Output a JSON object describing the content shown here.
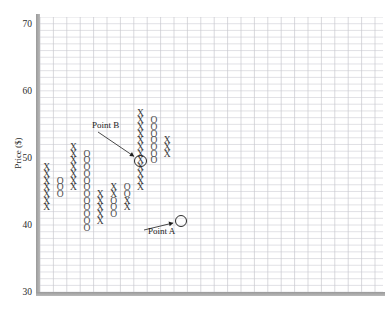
{
  "chart": {
    "type": "point-and-figure",
    "ylabel": "Price ($)",
    "yticks": [
      70,
      60,
      50,
      40,
      30
    ],
    "ylim": [
      30,
      71
    ],
    "xlim": [
      0,
      25
    ],
    "grid": true,
    "grid_color": "#c8c8cf",
    "axis_color": "#9a9a9a",
    "cell_width": 13.4,
    "cell_height": 6.71,
    "annotations": [
      {
        "label": "Point B",
        "marker": "X",
        "col": 8,
        "price": 50,
        "label_x": 92,
        "label_y": 120
      },
      {
        "label": "Point A",
        "marker": "X",
        "col": 11,
        "price": 41,
        "label_x": 148,
        "label_y": 226
      }
    ],
    "columns": [
      {
        "col": 1,
        "mark": "X",
        "prices": [
          41,
          42,
          43,
          44,
          45,
          46,
          47,
          48,
          49,
          50,
          51
        ]
      },
      {
        "col": 2,
        "mark": "O",
        "prices": [
          45,
          46,
          47,
          48,
          49
        ]
      },
      {
        "col": 3,
        "mark": "X",
        "prices": [
          47,
          48,
          49,
          50,
          51,
          52,
          53,
          54,
          55,
          56
        ]
      },
      {
        "col": 4,
        "mark": "O",
        "prices": [
          44,
          45,
          46,
          47,
          48,
          49,
          50,
          51,
          52,
          53,
          54,
          55
        ]
      },
      {
        "col": 5,
        "mark": "X",
        "prices": [
          44
        ]
      },
      {
        "col": 6,
        "mark": "O",
        "prices": [
          35,
          36,
          37,
          38,
          39,
          40,
          41,
          42,
          43
        ]
      },
      {
        "col": 7,
        "mark": "X",
        "prices": [
          37,
          38,
          39,
          40,
          41,
          42
        ]
      },
      {
        "col": 8,
        "mark": "O",
        "prices": [
          39,
          40,
          41,
          42
        ]
      },
      {
        "col": 9,
        "mark": "X",
        "prices": [
          41
        ]
      },
      {
        "col": 10,
        "mark": "X",
        "prices": [
          47,
          48
        ]
      },
      {
        "col": 11,
        "mark": "O",
        "prices": [
          47
        ]
      },
      {
        "col": 12,
        "mark": "X",
        "prices": [
          47,
          48,
          49,
          50,
          51,
          52,
          53,
          54,
          55,
          56,
          57
        ]
      },
      {
        "col": 13,
        "mark": "O",
        "prices": [
          50,
          51,
          52,
          53,
          54,
          55,
          56
        ]
      },
      {
        "col": 14,
        "mark": "X",
        "prices": [
          53,
          54,
          55,
          56
        ]
      }
    ],
    "cells": [
      {
        "c": 8,
        "r": 57,
        "m": "X"
      },
      {
        "c": 8,
        "r": 56,
        "m": "X"
      },
      {
        "c": 9,
        "r": 56,
        "m": "O"
      },
      {
        "c": 8,
        "r": 55,
        "m": "X"
      },
      {
        "c": 9,
        "r": 55,
        "m": "O"
      },
      {
        "c": 8,
        "r": 54,
        "m": "X"
      },
      {
        "c": 9,
        "r": 54,
        "m": "O"
      },
      {
        "c": 8,
        "r": 53,
        "m": "X"
      },
      {
        "c": 9,
        "r": 53,
        "m": "O"
      },
      {
        "c": 10,
        "r": 53,
        "m": "X"
      },
      {
        "c": 3,
        "r": 52,
        "m": "X"
      },
      {
        "c": 8,
        "r": 52,
        "m": "X"
      },
      {
        "c": 9,
        "r": 52,
        "m": "O"
      },
      {
        "c": 10,
        "r": 52,
        "m": "X"
      },
      {
        "c": 3,
        "r": 51,
        "m": "X"
      },
      {
        "c": 4,
        "r": 51,
        "m": "O"
      },
      {
        "c": 8,
        "r": 51,
        "m": "X"
      },
      {
        "c": 9,
        "r": 51,
        "m": "O"
      },
      {
        "c": 10,
        "r": 51,
        "m": "X"
      },
      {
        "c": 3,
        "r": 50,
        "m": "X"
      },
      {
        "c": 4,
        "r": 50,
        "m": "O"
      },
      {
        "c": 8,
        "r": 50,
        "m": "X"
      },
      {
        "c": 9,
        "r": 50,
        "m": "O"
      },
      {
        "c": 1,
        "r": 49,
        "m": "X"
      },
      {
        "c": 3,
        "r": 49,
        "m": "X"
      },
      {
        "c": 4,
        "r": 49,
        "m": "O"
      },
      {
        "c": 8,
        "r": 49,
        "m": "X"
      },
      {
        "c": 1,
        "r": 48,
        "m": "X"
      },
      {
        "c": 3,
        "r": 48,
        "m": "X"
      },
      {
        "c": 4,
        "r": 48,
        "m": "O"
      },
      {
        "c": 8,
        "r": 48,
        "m": "X"
      },
      {
        "c": 1,
        "r": 47,
        "m": "X"
      },
      {
        "c": 2,
        "r": 47,
        "m": "O"
      },
      {
        "c": 3,
        "r": 47,
        "m": "X"
      },
      {
        "c": 4,
        "r": 47,
        "m": "O"
      },
      {
        "c": 8,
        "r": 47,
        "m": "X"
      },
      {
        "c": 1,
        "r": 46,
        "m": "X"
      },
      {
        "c": 2,
        "r": 46,
        "m": "O"
      },
      {
        "c": 3,
        "r": 46,
        "m": "X"
      },
      {
        "c": 4,
        "r": 46,
        "m": "O"
      },
      {
        "c": 6,
        "r": 46,
        "m": "X"
      },
      {
        "c": 7,
        "r": 46,
        "m": "O"
      },
      {
        "c": 8,
        "r": 46,
        "m": "X"
      },
      {
        "c": 1,
        "r": 45,
        "m": "X"
      },
      {
        "c": 2,
        "r": 45,
        "m": "O"
      },
      {
        "c": 4,
        "r": 45,
        "m": "O"
      },
      {
        "c": 5,
        "r": 45,
        "m": "X"
      },
      {
        "c": 6,
        "r": 45,
        "m": "X"
      },
      {
        "c": 7,
        "r": 45,
        "m": "O"
      },
      {
        "c": 1,
        "r": 44,
        "m": "X"
      },
      {
        "c": 4,
        "r": 44,
        "m": "O"
      },
      {
        "c": 5,
        "r": 44,
        "m": "X"
      },
      {
        "c": 6,
        "r": 44,
        "m": "O"
      },
      {
        "c": 7,
        "r": 44,
        "m": "X"
      },
      {
        "c": 1,
        "r": 43,
        "m": "X"
      },
      {
        "c": 4,
        "r": 43,
        "m": "O"
      },
      {
        "c": 5,
        "r": 43,
        "m": "X"
      },
      {
        "c": 6,
        "r": 43,
        "m": "O"
      },
      {
        "c": 7,
        "r": 43,
        "m": "X"
      },
      {
        "c": 4,
        "r": 42,
        "m": "O"
      },
      {
        "c": 5,
        "r": 42,
        "m": "X"
      },
      {
        "c": 6,
        "r": 42,
        "m": "O"
      },
      {
        "c": 4,
        "r": 41,
        "m": "O"
      },
      {
        "c": 5,
        "r": 41,
        "m": "X"
      },
      {
        "c": 4,
        "r": 40,
        "m": "O"
      }
    ]
  }
}
